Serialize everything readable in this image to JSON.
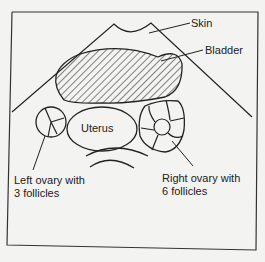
{
  "diagram": {
    "type": "ultrasound-cross-section",
    "labels": {
      "skin": "Skin",
      "bladder": "Bladder",
      "uterus": "Uterus",
      "left_ovary_line1": "Left ovary with",
      "left_ovary_line2": "3 follicles",
      "right_ovary_line1": "Right ovary with",
      "right_ovary_line2": "6 follicles"
    },
    "structures": [
      {
        "name": "Skin",
        "kind": "surface"
      },
      {
        "name": "Bladder",
        "kind": "hatched-region"
      },
      {
        "name": "Uterus",
        "kind": "oval"
      },
      {
        "name": "Left ovary",
        "follicles": 3
      },
      {
        "name": "Right ovary",
        "follicles": 6
      }
    ],
    "colors": {
      "ink": "#222222",
      "background": "#f3f3f1"
    }
  }
}
